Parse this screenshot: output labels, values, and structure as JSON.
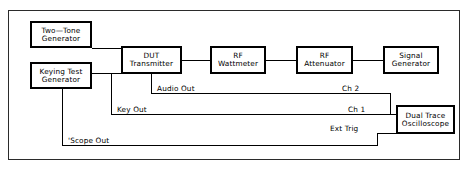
{
  "diagram": {
    "frame_border_color": "#2b2b2b",
    "box_border_color": "#000000",
    "wire_color": "#000000",
    "background_color": "#ffffff",
    "blocks": [
      {
        "id": "two-tone-generator",
        "line1": "Two—Tone",
        "line2": "Generator"
      },
      {
        "id": "keying-test-generator",
        "line1": "Keying Test",
        "line2": "Generator"
      },
      {
        "id": "dut-transmitter",
        "line1": "DUT",
        "line2": "Transmitter"
      },
      {
        "id": "rf-wattmeter",
        "line1": "RF",
        "line2": "Wattmeter"
      },
      {
        "id": "rf-attenuator",
        "line1": "RF",
        "line2": "Attenuator"
      },
      {
        "id": "signal-generator",
        "line1": "Signal",
        "line2": "Generator"
      },
      {
        "id": "dual-trace-oscilloscope",
        "line1": "Dual Trace",
        "line2": "Oscilloscope"
      }
    ],
    "signal_labels": [
      {
        "id": "audio-out",
        "text": "Audio Out"
      },
      {
        "id": "key-out",
        "text": "Key Out"
      },
      {
        "id": "scope-out",
        "text": "'Scope Out"
      },
      {
        "id": "ch-2",
        "text": "Ch 2"
      },
      {
        "id": "ch-1",
        "text": "Ch 1"
      },
      {
        "id": "ext-trig",
        "text": "Ext Trig"
      }
    ],
    "connections": [
      {
        "from": "two-tone-generator",
        "to": "dut-transmitter",
        "signal": ""
      },
      {
        "from": "keying-test-generator",
        "to": "dut-transmitter",
        "signal": ""
      },
      {
        "from": "dut-transmitter",
        "to": "rf-wattmeter",
        "signal": ""
      },
      {
        "from": "rf-wattmeter",
        "to": "rf-attenuator",
        "signal": ""
      },
      {
        "from": "signal-generator",
        "to": "rf-attenuator",
        "signal": "",
        "arrow": "left"
      },
      {
        "from": "dut-transmitter",
        "to": "dual-trace-oscilloscope",
        "signal": "Audio Out / Ch 2"
      },
      {
        "from": "keying-test-generator",
        "to": "dual-trace-oscilloscope",
        "signal": "Key Out / Ch 1"
      },
      {
        "from": "keying-test-generator",
        "to": "dual-trace-oscilloscope",
        "signal": "'Scope Out / Ext Trig"
      }
    ]
  }
}
